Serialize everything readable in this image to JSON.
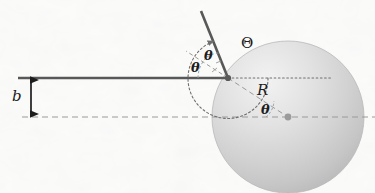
{
  "figure": {
    "kind": "hard-sphere-scattering-diagram",
    "width": 375,
    "height": 193,
    "background_color": "#fbfbfa"
  },
  "labels": {
    "impact_parameter": "b",
    "sphere_radius": "R",
    "incidence_angle": "θ",
    "reflection_angle": "θ",
    "center_angle": "θ",
    "scattering_angle": "Θ"
  },
  "colors": {
    "ray": "#585858",
    "dashed_guide": "#9a9a9a",
    "dotted_guide": "#6e6e6e",
    "sphere_fill_light": "#eeeeee",
    "sphere_fill_dark": "#c2c2c2",
    "sphere_edge": "#b4b4b4",
    "center_dot": "#9b9b9b",
    "impact_dot": "#585858",
    "text": "#1d1d1d"
  },
  "geometry": {
    "impact_point": {
      "x": 228,
      "y": 78
    },
    "sphere_center": {
      "x": 288,
      "y": 117
    },
    "sphere_radius_px": 76,
    "incoming_ray": {
      "x1": 18,
      "y1": 78,
      "x2": 228,
      "y2": 78
    },
    "outgoing_ray": {
      "x1": 228,
      "y1": 78,
      "x2": 201,
      "y2": 11
    },
    "normal_dashed": {
      "x1": 228,
      "y1": 78,
      "x2": 186,
      "y2": 51
    },
    "radius_dashed": {
      "x1": 228,
      "y1": 78,
      "x2": 288,
      "y2": 117
    },
    "axis_dashed": {
      "x1": 22,
      "y1": 117,
      "x2": 375,
      "y2": 117
    },
    "tangent_dotted": {
      "x1": 228,
      "y1": 78,
      "x2": 330,
      "y2": 78
    },
    "impact_arrow": {
      "x": 31,
      "y_top": 77,
      "y_bottom": 116
    }
  },
  "label_positions": {
    "b": {
      "x": 14,
      "y": 90
    },
    "theta_up": {
      "x": 204,
      "y": 50
    },
    "theta_lo": {
      "x": 193,
      "y": 62
    },
    "Theta": {
      "x": 241,
      "y": 37
    },
    "R": {
      "x": 258,
      "y": 84
    },
    "theta_c": {
      "x": 262,
      "y": 104
    }
  }
}
